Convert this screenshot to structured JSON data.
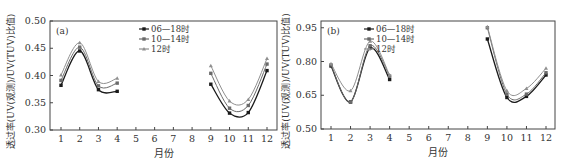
{
  "chart_data": [
    {
      "type": "line",
      "panel_label": "(a)",
      "title": "",
      "xlabel": "月份",
      "ylabel": "透过率(UV(观测)/UV(TUV)比值)",
      "x": [
        1,
        2,
        3,
        4,
        5,
        6,
        7,
        8,
        9,
        10,
        11,
        12
      ],
      "x_tick_labels": [
        "1",
        "2",
        "3",
        "4",
        "5",
        "6",
        "7",
        "8",
        "9",
        "10",
        "11",
        "12"
      ],
      "ylim": [
        0.3,
        0.5
      ],
      "y_ticks": [
        "0.30",
        "0.35",
        "0.40",
        "0.45",
        "0.50"
      ],
      "grid": false,
      "legend_position": "upper center",
      "series": [
        {
          "name": "06—18时",
          "color": "#1a1a1a",
          "marker": "square",
          "x": [
            1,
            2,
            3,
            4,
            9,
            10,
            11,
            12
          ],
          "values": [
            0.382,
            0.445,
            0.374,
            0.371,
            0.384,
            0.331,
            0.332,
            0.409
          ]
        },
        {
          "name": "10—14时",
          "color": "#6a6a6a",
          "marker": "square",
          "x": [
            1,
            2,
            3,
            4,
            9,
            10,
            11,
            12
          ],
          "values": [
            0.391,
            0.452,
            0.381,
            0.386,
            0.404,
            0.34,
            0.345,
            0.421
          ]
        },
        {
          "name": "12时",
          "color": "#8f8f8f",
          "marker": "triangle",
          "x": [
            1,
            2,
            3,
            4,
            9,
            10,
            11,
            12
          ],
          "values": [
            0.401,
            0.46,
            0.389,
            0.395,
            0.418,
            0.353,
            0.356,
            0.431
          ]
        }
      ]
    },
    {
      "type": "line",
      "panel_label": "(b)",
      "title": "",
      "xlabel": "月份",
      "ylabel": "透过率(UV(观测)/UV(TUV)比值)",
      "x": [
        1,
        2,
        3,
        4,
        5,
        6,
        7,
        8,
        9,
        10,
        11,
        12
      ],
      "x_tick_labels": [
        "1",
        "2",
        "3",
        "4",
        "5",
        "6",
        "7",
        "8",
        "9",
        "10",
        "11",
        "12"
      ],
      "ylim": [
        0.5,
        0.98
      ],
      "y_ticks": [
        "0.50",
        "0.65",
        "0.80",
        "0.95"
      ],
      "grid": false,
      "legend_position": "upper center",
      "series": [
        {
          "name": "06—18时",
          "color": "#1a1a1a",
          "marker": "square",
          "x": [
            1,
            2,
            3,
            4,
            9,
            10,
            11,
            12
          ],
          "values": [
            0.78,
            0.62,
            0.86,
            0.72,
            0.9,
            0.64,
            0.645,
            0.74
          ]
        },
        {
          "name": "10—14时",
          "color": "#6a6a6a",
          "marker": "square",
          "x": [
            1,
            2,
            3,
            4,
            9,
            10,
            11,
            12
          ],
          "values": [
            0.785,
            0.62,
            0.87,
            0.735,
            0.95,
            0.655,
            0.655,
            0.75
          ]
        },
        {
          "name": "12时",
          "color": "#8f8f8f",
          "marker": "triangle",
          "x": [
            1,
            2,
            3,
            4,
            9,
            10,
            11,
            12
          ],
          "values": [
            0.79,
            0.67,
            0.89,
            0.74,
            0.955,
            0.67,
            0.68,
            0.77
          ]
        }
      ]
    }
  ],
  "layout": {
    "panels": [
      {
        "box": [
          50,
          21,
          277,
          130
        ],
        "x_first_px": 61,
        "x_last_px": 267,
        "ylabel_x": 14
      },
      {
        "box": [
          321,
          21,
          555,
          129
        ],
        "x_first_px": 331,
        "x_last_px": 546,
        "ylabel_x": 289
      }
    ]
  }
}
